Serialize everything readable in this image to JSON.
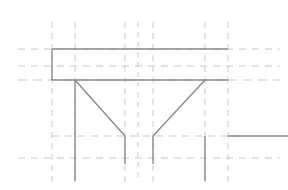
{
  "viewport": {
    "name": "cad-drawing-viewport",
    "width": 288,
    "height": 190,
    "background_color": "#ffffff",
    "description": "Technical CAD line drawing of a symmetric beam / truss cross-section with construction guide lines"
  },
  "styles": {
    "construction_line_color": "#c8c8c8",
    "geometry_line_color": "#8a8a8a",
    "construction_line_width": 1,
    "geometry_line_width": 1.4,
    "construction_dash_pattern": "6 5",
    "construction_dash_pattern_short": "4 4"
  },
  "construction_lines": {
    "label": "construction-guides",
    "vertical": [
      {
        "id": "v1",
        "x": 52,
        "y1": 22,
        "y2": 182,
        "dash": "6 5"
      },
      {
        "id": "v2",
        "x": 75,
        "y1": 22,
        "y2": 182,
        "dash": "6 5"
      },
      {
        "id": "v3",
        "x": 125,
        "y1": 22,
        "y2": 182,
        "dash": "6 5"
      },
      {
        "id": "v4",
        "x": 138,
        "y1": 22,
        "y2": 182,
        "dash": "5 5"
      },
      {
        "id": "v5",
        "x": 153,
        "y1": 22,
        "y2": 182,
        "dash": "6 5"
      },
      {
        "id": "v6",
        "x": 205,
        "y1": 22,
        "y2": 182,
        "dash": "6 5"
      },
      {
        "id": "v7",
        "x": 228,
        "y1": 22,
        "y2": 182,
        "dash": "6 5"
      }
    ],
    "horizontal": [
      {
        "id": "h1",
        "y": 49,
        "x1": 18,
        "x2": 280,
        "dash": "7 6"
      },
      {
        "id": "h2",
        "y": 66,
        "x1": 18,
        "x2": 280,
        "dash": "7 6"
      },
      {
        "id": "h3",
        "y": 80,
        "x1": 18,
        "x2": 280,
        "dash": "9 6"
      },
      {
        "id": "h4",
        "y": 136,
        "x1": 52,
        "x2": 240,
        "dash": "7 6"
      },
      {
        "id": "h5",
        "y": 158,
        "x1": 18,
        "x2": 280,
        "dash": "7 6"
      }
    ]
  },
  "geometry_lines": {
    "label": "solid-geometry",
    "segments": [
      {
        "id": "top-chord",
        "x1": 52,
        "y1": 49,
        "x2": 228,
        "y2": 49
      },
      {
        "id": "bottom-chord",
        "x1": 52,
        "y1": 80,
        "x2": 228,
        "y2": 80
      },
      {
        "id": "left-end-post",
        "x1": 52,
        "y1": 49,
        "x2": 52,
        "y2": 80
      },
      {
        "id": "left-diagonal",
        "x1": 75,
        "y1": 80,
        "x2": 125,
        "y2": 136
      },
      {
        "id": "right-diagonal",
        "x1": 153,
        "y1": 136,
        "x2": 205,
        "y2": 80
      },
      {
        "id": "left-web-post",
        "x1": 75,
        "y1": 80,
        "x2": 75,
        "y2": 181
      },
      {
        "id": "center-left-post",
        "x1": 125,
        "y1": 136,
        "x2": 125,
        "y2": 164
      },
      {
        "id": "center-right-post",
        "x1": 153,
        "y1": 136,
        "x2": 153,
        "y2": 164
      },
      {
        "id": "right-web-post",
        "x1": 205,
        "y1": 136,
        "x2": 205,
        "y2": 181
      },
      {
        "id": "lower-right-chord",
        "x1": 228,
        "y1": 136,
        "x2": 288,
        "y2": 136
      }
    ]
  }
}
